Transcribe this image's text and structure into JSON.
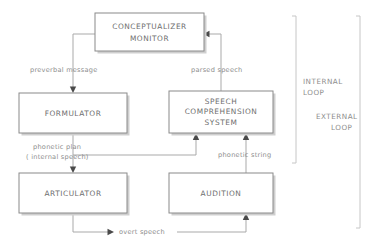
{
  "diagram": {
    "colors": {
      "background": "#ffffff",
      "box_border": "#8a8a8a",
      "box_shadow": "#cfcfcf",
      "box_text": "#6e6e6e",
      "edge_line": "#a9a9a9",
      "arrow_head": "#4a4a4a",
      "edge_text": "#8d8d8d",
      "bracket": "#c6c6c6"
    },
    "boxes": [
      {
        "id": "conceptualizer",
        "name": "conceptualizer-monitor-box",
        "lines": [
          "CONCEPTUALIZER",
          "MONITOR"
        ],
        "x": 95,
        "y": 13,
        "w": 109,
        "h": 38
      },
      {
        "id": "formulator",
        "name": "formulator-box",
        "lines": [
          "FORMULATOR"
        ],
        "x": 19,
        "y": 93,
        "w": 108,
        "h": 40
      },
      {
        "id": "speech_comprehension",
        "name": "speech-comprehension-system-box",
        "lines": [
          "SPEECH",
          "COMPREHENSION",
          "SYSTEM"
        ],
        "x": 169,
        "y": 91,
        "w": 104,
        "h": 42
      },
      {
        "id": "articulator",
        "name": "articulator-box",
        "lines": [
          "ARTICULATOR"
        ],
        "x": 19,
        "y": 173,
        "w": 108,
        "h": 40
      },
      {
        "id": "audition",
        "name": "audition-box",
        "lines": [
          "AUDITION"
        ],
        "x": 169,
        "y": 173,
        "w": 104,
        "h": 40
      }
    ],
    "edges": [
      {
        "id": "preverbal",
        "name": "edge-preverbal-message",
        "label": "preverbal message",
        "label_x": 30,
        "label_y": 70,
        "from": "conceptualizer",
        "to": "formulator"
      },
      {
        "id": "parsed",
        "name": "edge-parsed-speech",
        "label": "parsed speech",
        "label_x": 191,
        "label_y": 70,
        "from": "speech_comprehension",
        "to": "conceptualizer"
      },
      {
        "id": "phonetic_plan",
        "name": "edge-phonetic-plan",
        "label": "phonetic plan",
        "label_x": 33,
        "label_y": 147,
        "from": "formulator",
        "to": "articulator"
      },
      {
        "id": "internal_speech",
        "name": "edge-internal-speech",
        "label": "( internal speech)",
        "label_x": 26,
        "label_y": 157,
        "from": "formulator",
        "to": "speech_comprehension"
      },
      {
        "id": "phonetic_string",
        "name": "edge-phonetic-string",
        "label": "phonetic string",
        "label_x": 218,
        "label_y": 155,
        "from": "audition",
        "to": "speech_comprehension"
      },
      {
        "id": "overt_speech",
        "name": "edge-overt-speech",
        "label": "overt speech",
        "label_x": 119,
        "label_y": 232,
        "from": "articulator",
        "to": "audition"
      }
    ],
    "loops": [
      {
        "id": "internal_loop",
        "name": "internal-loop-label",
        "lines": [
          "INTERNAL",
          "LOOP"
        ],
        "x": 303,
        "y": 82,
        "align": "start"
      },
      {
        "id": "external_loop",
        "name": "external-loop-label",
        "lines": [
          "EXTERNAL",
          "LOOP"
        ],
        "x": 316,
        "y": 117,
        "align": "start"
      }
    ],
    "brackets": [
      {
        "id": "internal_bracket",
        "name": "internal-loop-bracket",
        "x": 296,
        "y_top": 15,
        "y_bottom": 163
      },
      {
        "id": "external_bracket",
        "name": "external-loop-bracket",
        "x": 360,
        "y_top": 15,
        "y_bottom": 228
      }
    ]
  }
}
